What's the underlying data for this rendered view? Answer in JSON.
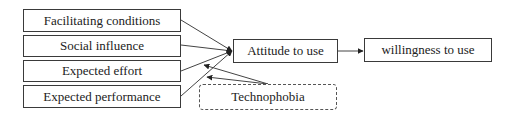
{
  "diagram": {
    "nodes": [
      {
        "id": "facilitating",
        "label": "Facilitating conditions"
      },
      {
        "id": "social",
        "label": "Social influence"
      },
      {
        "id": "effort",
        "label": "Expected effort"
      },
      {
        "id": "performance",
        "label": "Expected performance"
      },
      {
        "id": "attitude",
        "label": "Attitude to use"
      },
      {
        "id": "willingness",
        "label": "willingness to use"
      },
      {
        "id": "technophobia",
        "label": "Technophobia",
        "style": "dashed"
      }
    ],
    "edges": [
      {
        "from": "facilitating",
        "to": "attitude"
      },
      {
        "from": "social",
        "to": "attitude"
      },
      {
        "from": "effort",
        "to": "attitude"
      },
      {
        "from": "performance",
        "to": "attitude"
      },
      {
        "from": "attitude",
        "to": "willingness"
      },
      {
        "from": "technophobia",
        "to": "effort->attitude",
        "type": "moderation"
      },
      {
        "from": "technophobia",
        "to": "performance->attitude",
        "type": "moderation"
      }
    ],
    "colors": {
      "line": "#3a3a3a",
      "border": "#3a3a3a"
    }
  }
}
